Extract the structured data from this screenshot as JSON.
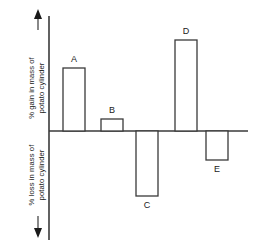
{
  "chart_data": {
    "type": "bar",
    "title": "",
    "subtitle": "",
    "xlabel": "",
    "ylabel": "% gain in mass of potato cylinder / % loss in mass of potato cylinder",
    "axis_label_positive": "% gain in mass of potato cylinder",
    "axis_label_negative": "% loss in mass of potato cylinder",
    "axis_label_positive_line1": "% gain in mass of",
    "axis_label_positive_line2": "potato cylinder",
    "axis_label_negative_line1": "% loss in mass of",
    "axis_label_negative_line2": "potato cylinder",
    "categories": [
      "A",
      "B",
      "C",
      "D",
      "E"
    ],
    "values": [
      63,
      12,
      -65,
      91,
      -29
    ],
    "ylim": [
      -100,
      100
    ],
    "grid": false,
    "legend": false,
    "legend_position": "none",
    "tick_labels_y": [],
    "tick_labels_x": [
      "A",
      "B",
      "C",
      "D",
      "E"
    ],
    "annotations": [
      "upward arrow on positive y-axis",
      "downward arrow on negative y-axis"
    ],
    "bar_style": "unfilled outline",
    "zero_line": 0
  },
  "colors": {
    "stroke": "#3a3a3a",
    "bar_fill": "#ffffff",
    "text": "#1a1a1a",
    "background": "#ffffff"
  },
  "bars": [
    {
      "label": "A",
      "value": 63,
      "label_position": "above"
    },
    {
      "label": "B",
      "value": 12,
      "label_position": "above"
    },
    {
      "label": "C",
      "value": -65,
      "label_position": "below"
    },
    {
      "label": "D",
      "value": 91,
      "label_position": "above"
    },
    {
      "label": "E",
      "value": -29,
      "label_position": "below"
    }
  ],
  "icons": {
    "up_arrow": "up-arrow-icon",
    "down_arrow": "down-arrow-icon"
  }
}
